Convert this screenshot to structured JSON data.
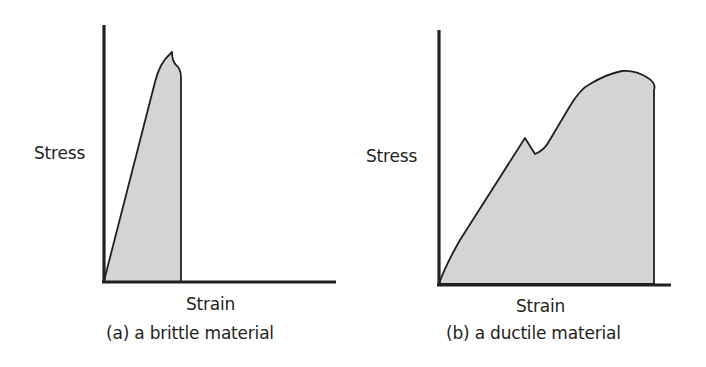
{
  "figure": {
    "panels": [
      {
        "id": "a",
        "ylabel": "Stress",
        "xlabel": "Strain",
        "caption": "(a) a brittle material"
      },
      {
        "id": "b",
        "ylabel": "Stress",
        "xlabel": "Strain",
        "caption": "(b) a ductile material"
      }
    ],
    "colors": {
      "fill": "#d4d4d4",
      "stroke": "#231f20",
      "background": "#ffffff"
    }
  }
}
